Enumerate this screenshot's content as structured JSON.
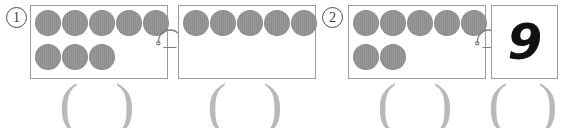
{
  "worksheet": {
    "type": "math-decomposition-worksheet",
    "background_color": "#ffffff",
    "dot_color": "#8d8d8d",
    "box_border_color": "#9b9b9b",
    "paren_color": "#b9b9b9",
    "ink_color": "#111111"
  },
  "problems": [
    {
      "number_label": "1",
      "boxes": [
        {
          "name": "box-1a",
          "rows": [
            {
              "count": 5
            },
            {
              "count": 3
            }
          ],
          "total_dots": 8,
          "answer": ""
        },
        {
          "name": "box-1b",
          "rows": [
            {
              "count": 5
            },
            {
              "count": 0
            }
          ],
          "total_dots": 5,
          "answer": ""
        }
      ],
      "connector": "arc-hook-connector"
    },
    {
      "number_label": "2",
      "boxes": [
        {
          "name": "box-2a",
          "rows": [
            {
              "count": 5
            },
            {
              "count": 2
            }
          ],
          "total_dots": 7,
          "answer": ""
        },
        {
          "name": "box-2b",
          "rows": [
            {
              "count": 0
            },
            {
              "count": 0
            }
          ],
          "total_dots": 0,
          "handwritten_value": "9",
          "answer": ""
        }
      ],
      "connector": "arc-hook-connector"
    }
  ],
  "answer_slots": [
    {
      "name": "answer-slot-1",
      "open": "(",
      "close": ")",
      "value": ""
    },
    {
      "name": "answer-slot-2",
      "open": "(",
      "close": ")",
      "value": ""
    },
    {
      "name": "answer-slot-3",
      "open": "(",
      "close": ")",
      "value": ""
    },
    {
      "name": "answer-slot-4",
      "open": "(",
      "close": ")",
      "value": ""
    }
  ]
}
